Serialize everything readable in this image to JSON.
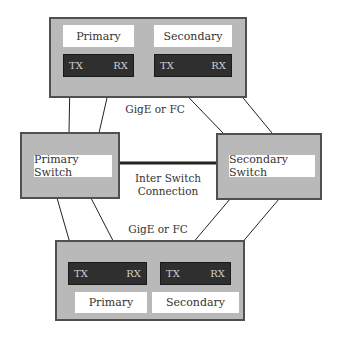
{
  "top_storage": {
    "primary": {
      "label": "Primary",
      "tx": "TX",
      "rx": "RX"
    },
    "secondary": {
      "label": "Secondary",
      "tx": "TX",
      "rx": "RX"
    }
  },
  "top_link_label": "GigE or FC",
  "switches": {
    "primary": "Primary Switch",
    "secondary": "Secondary Switch",
    "inter_switch_label_line1": "Inter Switch",
    "inter_switch_label_line2": "Connection"
  },
  "bottom_link_label": "GigE or FC",
  "bottom_storage": {
    "primary": {
      "label": "Primary",
      "tx": "TX",
      "rx": "RX"
    },
    "secondary": {
      "label": "Secondary",
      "tx": "TX",
      "rx": "RX"
    }
  },
  "colors": {
    "panel": "#b9b9b9",
    "border": "#505050",
    "port": "#2f2f2f",
    "port_text": "#d0d0d0",
    "line": "#222222"
  }
}
